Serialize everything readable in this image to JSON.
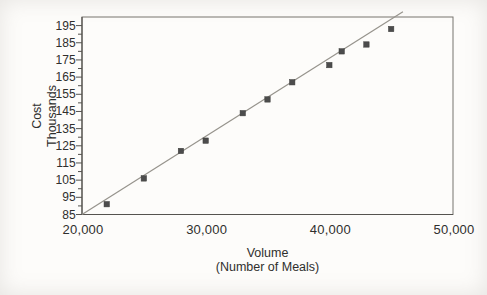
{
  "chart_data": {
    "type": "scatter",
    "title": "",
    "xlabel": "Volume",
    "xlabel_sub": "(Number of Meals)",
    "ylabel": "Cost",
    "ylabel_sub": "Thousands",
    "xlim": [
      20000,
      50000
    ],
    "ylim": [
      85,
      195
    ],
    "y_axis_extent": [
      85,
      200
    ],
    "grid": false,
    "legend_position": "none",
    "x_ticks": [
      {
        "value": 20000,
        "label": "20,000"
      },
      {
        "value": 30000,
        "label": "30,000"
      },
      {
        "value": 40000,
        "label": "40,000"
      },
      {
        "value": 50000,
        "label": "50,000"
      }
    ],
    "y_ticks": [
      {
        "value": 195,
        "label": "195"
      },
      {
        "value": 185,
        "label": "185"
      },
      {
        "value": 175,
        "label": "175"
      },
      {
        "value": 165,
        "label": "165"
      },
      {
        "value": 155,
        "label": "155"
      },
      {
        "value": 145,
        "label": "145"
      },
      {
        "value": 135,
        "label": "135"
      },
      {
        "value": 125,
        "label": "125"
      },
      {
        "value": 115,
        "label": "115"
      },
      {
        "value": 105,
        "label": "105"
      },
      {
        "value": 95,
        "label": "95"
      },
      {
        "value": 85,
        "label": "85"
      }
    ],
    "y_minor_tick_step": 5,
    "series": [
      {
        "name": "cost-observations",
        "marker": "square",
        "points": [
          {
            "meals": 22000,
            "cost_thousands": 91
          },
          {
            "meals": 25000,
            "cost_thousands": 106
          },
          {
            "meals": 28000,
            "cost_thousands": 122
          },
          {
            "meals": 30000,
            "cost_thousands": 128
          },
          {
            "meals": 33000,
            "cost_thousands": 144
          },
          {
            "meals": 35000,
            "cost_thousands": 152
          },
          {
            "meals": 37000,
            "cost_thousands": 162
          },
          {
            "meals": 40000,
            "cost_thousands": 172
          },
          {
            "meals": 41000,
            "cost_thousands": 180
          },
          {
            "meals": 43000,
            "cost_thousands": 184
          },
          {
            "meals": 45000,
            "cost_thousands": 193
          }
        ]
      }
    ],
    "trend_line": {
      "x1_meals": 20000,
      "y1_cost": 85,
      "x2_meals": 45950,
      "y2_cost": 203
    },
    "colors": {
      "marker": "#4c4c4c",
      "trend_line": "#96938c",
      "frame": "#77756f",
      "axis": "#55534f",
      "text": "#2f2f2d",
      "background": "#fdfcfa"
    }
  }
}
